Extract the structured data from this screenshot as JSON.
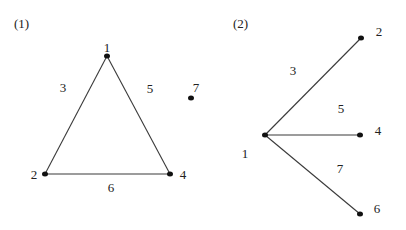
{
  "figures": [
    {
      "id": "fig1",
      "caption": "(1)",
      "caption_pos": [
        14,
        28
      ],
      "nodes": [
        {
          "label": "1",
          "x": 107,
          "y": 56,
          "lx": 107,
          "ly": 52,
          "anchor": "middle"
        },
        {
          "label": "2",
          "x": 45,
          "y": 174,
          "lx": 34,
          "ly": 179,
          "anchor": "middle"
        },
        {
          "label": "4",
          "x": 170,
          "y": 174,
          "lx": 183,
          "ly": 179,
          "anchor": "middle"
        },
        {
          "label": "7",
          "x": 191,
          "y": 98,
          "lx": 196,
          "ly": 92,
          "anchor": "middle"
        }
      ],
      "edges": [
        {
          "from": 0,
          "to": 1,
          "label": "3",
          "lx": 63,
          "ly": 92
        },
        {
          "from": 0,
          "to": 2,
          "label": "5",
          "lx": 150,
          "ly": 93
        },
        {
          "from": 1,
          "to": 2,
          "label": "6",
          "lx": 111,
          "ly": 192
        }
      ]
    },
    {
      "id": "fig2",
      "caption": "(2)",
      "caption_pos": [
        233,
        28
      ],
      "nodes": [
        {
          "label": "1",
          "x": 265,
          "y": 135,
          "lx": 245,
          "ly": 158,
          "anchor": "middle"
        },
        {
          "label": "2",
          "x": 361,
          "y": 38,
          "lx": 379,
          "ly": 36,
          "anchor": "middle"
        },
        {
          "label": "4",
          "x": 360,
          "y": 135,
          "lx": 378,
          "ly": 135,
          "anchor": "middle"
        },
        {
          "label": "6",
          "x": 360,
          "y": 214,
          "lx": 377,
          "ly": 213,
          "anchor": "middle"
        }
      ],
      "edges": [
        {
          "from": 0,
          "to": 1,
          "label": "3",
          "lx": 293,
          "ly": 75
        },
        {
          "from": 0,
          "to": 2,
          "label": "5",
          "lx": 341,
          "ly": 113
        },
        {
          "from": 0,
          "to": 3,
          "label": "7",
          "lx": 340,
          "ly": 173
        }
      ]
    }
  ]
}
